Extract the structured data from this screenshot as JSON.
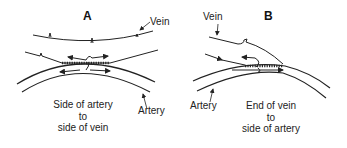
{
  "panels": [
    {
      "letter": "A",
      "labels": {
        "vein": "Vein",
        "artery": "Artery"
      },
      "caption": [
        "Side of artery",
        "to",
        "side of vein"
      ]
    },
    {
      "letter": "B",
      "labels": {
        "vein": "Vein",
        "artery": "Artery"
      },
      "caption": [
        "End of vein",
        "to",
        "side of artery"
      ]
    }
  ],
  "colors": {
    "line": "#222222",
    "background": "#ffffff"
  }
}
